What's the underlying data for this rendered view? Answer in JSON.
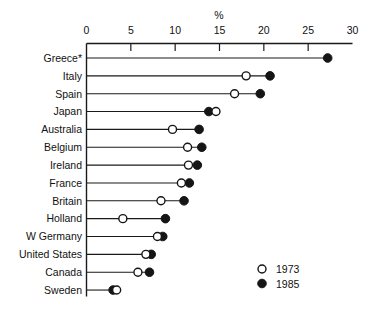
{
  "chart_data": {
    "type": "scatter",
    "title": "",
    "xlabel": "%",
    "ylabel": "",
    "xlim": [
      0,
      30
    ],
    "xticks": [
      0,
      5,
      10,
      15,
      20,
      25,
      30
    ],
    "xticklabels": [
      "0",
      "5",
      "10",
      "15",
      "20",
      "25",
      "30"
    ],
    "grid": false,
    "legend_position": "bottom-right",
    "categories": [
      "Greece*",
      "Italy",
      "Spain",
      "Japan",
      "Australia",
      "Belgium",
      "Ireland",
      "France",
      "Britain",
      "Holland",
      "W Germany",
      "United States",
      "Canada",
      "Sweden"
    ],
    "series": [
      {
        "name": "1973",
        "marker": "open-circle",
        "values": [
          null,
          18.0,
          16.7,
          14.6,
          9.7,
          11.4,
          11.5,
          10.7,
          8.4,
          4.1,
          8.0,
          6.7,
          5.8,
          3.4
        ]
      },
      {
        "name": "1985",
        "marker": "filled-circle",
        "values": [
          27.2,
          20.7,
          19.6,
          13.8,
          12.7,
          13.0,
          12.5,
          11.6,
          11.0,
          8.9,
          8.6,
          7.3,
          7.1,
          3.0
        ]
      }
    ],
    "legend": [
      {
        "label": "1973",
        "marker": "open-circle"
      },
      {
        "label": "1985",
        "marker": "filled-circle"
      }
    ],
    "colors": {
      "marker_fill": "#151515",
      "marker_open_fill": "#ffffff",
      "line": "#1a1a1a",
      "text": "#111111",
      "background": "#ffffff"
    }
  }
}
